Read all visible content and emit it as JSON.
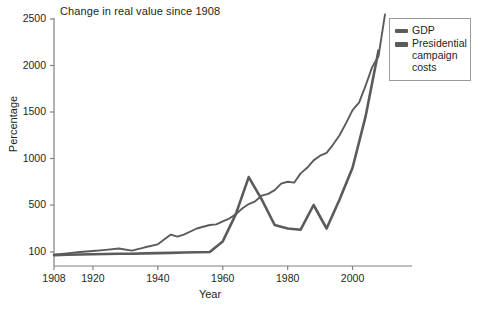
{
  "chart_data": {
    "type": "line",
    "title": "Change in real value since 1908",
    "xlabel": "Year",
    "ylabel": "Percentage",
    "grid": false,
    "legend_position": "top-right",
    "xlim": [
      1908,
      2010
    ],
    "xticks": [
      1908,
      1920,
      1940,
      1960,
      1980,
      2000
    ],
    "yticks": [
      100,
      500,
      1000,
      1500,
      2000,
      2500
    ],
    "ylim": [
      60,
      2600
    ],
    "y_axis_note": "broken axis: 100 then linear 500-2500",
    "series": [
      {
        "name": "GDP",
        "x": [
          1908,
          1912,
          1916,
          1920,
          1924,
          1928,
          1932,
          1936,
          1940,
          1944,
          1946,
          1948,
          1952,
          1956,
          1958,
          1960,
          1962,
          1964,
          1966,
          1968,
          1970,
          1972,
          1974,
          1976,
          1978,
          1980,
          1982,
          1984,
          1986,
          1988,
          1990,
          1992,
          1994,
          1996,
          1998,
          2000,
          2002,
          2004,
          2006,
          2008,
          2010
        ],
        "values": [
          80,
          90,
          100,
          108,
          118,
          130,
          112,
          140,
          165,
          248,
          230,
          248,
          300,
          330,
          335,
          360,
          385,
          420,
          470,
          510,
          540,
          600,
          620,
          660,
          730,
          750,
          740,
          840,
          900,
          980,
          1030,
          1060,
          1150,
          1250,
          1380,
          1520,
          1600,
          1780,
          1980,
          2100,
          2550
        ]
      },
      {
        "name": "Presidential campaign costs",
        "x": [
          1908,
          1912,
          1916,
          1920,
          1924,
          1928,
          1932,
          1936,
          1940,
          1944,
          1948,
          1952,
          1956,
          1960,
          1964,
          1968,
          1972,
          1976,
          1980,
          1984,
          1988,
          1992,
          1996,
          2000,
          2004,
          2008
        ],
        "values": [
          78,
          80,
          82,
          84,
          86,
          88,
          88,
          90,
          92,
          94,
          96,
          98,
          100,
          190,
          420,
          800,
          560,
          330,
          300,
          290,
          500,
          300,
          560,
          900,
          1450,
          2160
        ]
      }
    ]
  },
  "axes": {
    "ytick_labels": [
      "2500",
      "2000",
      "1500",
      "1000",
      "500",
      "100"
    ],
    "xtick_labels": [
      "1908",
      "1920",
      "1940",
      "1960",
      "1980",
      "2000"
    ]
  },
  "legend": {
    "items": [
      {
        "label": "GDP"
      },
      {
        "label": "Presidential campaign costs"
      }
    ]
  },
  "colors": {
    "line": "#5b5b5b",
    "axis": "#808080",
    "text": "#231f20",
    "legend_border": "#9a9a9a",
    "background": "#ffffff"
  }
}
